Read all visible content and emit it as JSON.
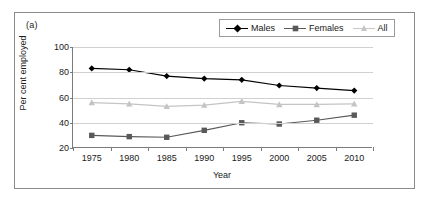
{
  "figure": {
    "panel_label": "(a)"
  },
  "chart_data": {
    "type": "line",
    "title": "",
    "xlabel": "Year",
    "ylabel": "Per cent employed",
    "categories": [
      1975,
      1980,
      1985,
      1990,
      1995,
      2000,
      2005,
      2010
    ],
    "xtick_labels": [
      "1975",
      "1980",
      "1985",
      "1990",
      "1995",
      "2000",
      "2005",
      "2010"
    ],
    "ytick_labels": [
      "20",
      "40",
      "60",
      "80",
      "100"
    ],
    "ytick_values": [
      20,
      40,
      60,
      80,
      100
    ],
    "ylim": [
      20,
      100
    ],
    "xlim": [
      1972.5,
      2012.5
    ],
    "grid": "horizontal",
    "legend_position": "top-right",
    "series": [
      {
        "name": "Males",
        "marker": "diamond",
        "color": "#000000",
        "values": [
          83,
          82,
          77,
          75,
          74,
          69.5,
          67.5,
          65.5
        ]
      },
      {
        "name": "Females",
        "marker": "square",
        "color": "#595959",
        "values": [
          30,
          29,
          28.5,
          34,
          40,
          39,
          42,
          46
        ]
      },
      {
        "name": "All",
        "marker": "triangle",
        "color": "#c4c4c4",
        "values": [
          56,
          55,
          53,
          54,
          57,
          54.5,
          54.5,
          55
        ]
      }
    ]
  },
  "legend": {
    "entries": [
      {
        "label": "Males"
      },
      {
        "label": "Females"
      },
      {
        "label": "All"
      }
    ]
  }
}
